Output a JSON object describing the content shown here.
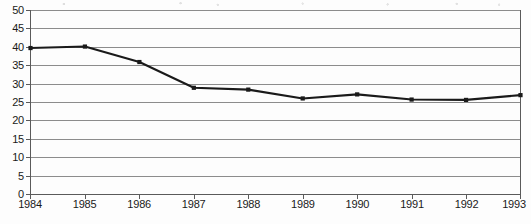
{
  "chart_data": {
    "type": "line",
    "title": "",
    "xlabel": "",
    "ylabel": "",
    "categories": [
      "1984",
      "1985",
      "1986",
      "1987",
      "1988",
      "1989",
      "1990",
      "1991",
      "1992",
      "1993"
    ],
    "x": [
      1984,
      1985,
      1986,
      1987,
      1988,
      1989,
      1990,
      1991,
      1992,
      1993
    ],
    "values": [
      39.8,
      40.2,
      36.0,
      29.0,
      28.5,
      26.1,
      27.2,
      25.8,
      25.7,
      27.0
    ],
    "series": [
      {
        "name": "",
        "values": [
          39.8,
          40.2,
          36.0,
          29.0,
          28.5,
          26.1,
          27.2,
          25.8,
          25.7,
          27.0
        ]
      }
    ],
    "ylim": [
      0,
      50
    ],
    "ytick_labels": [
      "0",
      "5",
      "10",
      "15",
      "20",
      "25",
      "30",
      "35",
      "40",
      "45",
      "50"
    ],
    "yticks": [
      0,
      5,
      10,
      15,
      20,
      25,
      30,
      35,
      40,
      45,
      50
    ],
    "xtick_labels": [
      "1984",
      "1985",
      "1986",
      "1987",
      "1988",
      "1989",
      "1990",
      "1991",
      "1992",
      "1993"
    ],
    "grid": "horizontal",
    "legend": "none",
    "marker": "square",
    "line_color": "#1a1a1a",
    "grid_color": "#8c8c8c",
    "axis_color": "#6f6f6f",
    "background_color": "#fdfdfd"
  }
}
